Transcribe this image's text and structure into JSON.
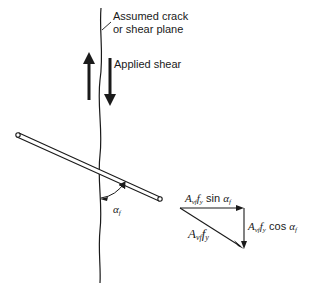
{
  "diagram": {
    "labels": {
      "crack_line1": "Assumed crack",
      "crack_line2": "or shear plane",
      "applied_shear": "Applied shear",
      "angle": "α",
      "angle_sub": "f"
    },
    "force_triangle": {
      "horizontal": {
        "A": "A",
        "A_sub": "vf",
        "f": "f",
        "f_sub": "y",
        "fn": " sin ",
        "ang": "α",
        "ang_sub": "f"
      },
      "vertical": {
        "A": "A",
        "A_sub": "vf",
        "f": "f",
        "f_sub": "y",
        "fn": " cos ",
        "ang": "α",
        "ang_sub": "f"
      },
      "resultant": {
        "A": "A",
        "A_sub": "vf",
        "f": "f",
        "f_sub": "y"
      }
    },
    "colors": {
      "ink": "#1a1a1a",
      "background": "#ffffff"
    }
  }
}
